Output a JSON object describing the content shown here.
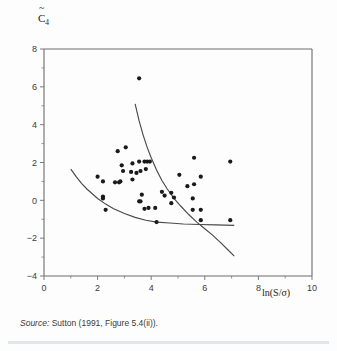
{
  "figure": {
    "ylabel_text": "C",
    "ylabel_sub": "4",
    "xlabel": "ln(S/σ)",
    "source_word": "Source:",
    "source_rest": " Sutton (1991, Figure 5.4(ii))."
  },
  "chart_data": {
    "type": "scatter",
    "title": "",
    "xlabel": "ln(S/σ)",
    "ylabel": "C̄4 (C-tilde sub 4)",
    "xlim": [
      0,
      10
    ],
    "ylim": [
      -4,
      8
    ],
    "xticks": [
      0,
      2,
      4,
      6,
      8,
      10
    ],
    "xticklabels": [
      "0",
      "2",
      "4",
      "6",
      "8",
      "10"
    ],
    "xminorticks": [
      1,
      3,
      5,
      7,
      9
    ],
    "yticks": [
      -4,
      -2,
      0,
      2,
      4,
      6,
      8
    ],
    "yticklabels": [
      "−4",
      "−2",
      "0",
      "2",
      "4",
      "6",
      "8"
    ],
    "yminorticks": [
      -3,
      -1,
      1,
      3,
      5,
      7
    ],
    "grid": false,
    "legend": null,
    "marker": "filled-circle",
    "marker_color": "#1a1a1a",
    "points": [
      [
        3.55,
        6.45
      ],
      [
        2.75,
        2.6
      ],
      [
        3.05,
        2.8
      ],
      [
        2.9,
        1.85
      ],
      [
        2.95,
        1.55
      ],
      [
        3.3,
        1.95
      ],
      [
        3.25,
        1.5
      ],
      [
        3.45,
        1.45
      ],
      [
        3.55,
        2.05
      ],
      [
        3.75,
        2.05
      ],
      [
        3.85,
        2.05
      ],
      [
        3.95,
        2.05
      ],
      [
        3.6,
        1.55
      ],
      [
        3.8,
        1.65
      ],
      [
        3.3,
        1.1
      ],
      [
        2.0,
        1.25
      ],
      [
        2.2,
        1.0
      ],
      [
        2.65,
        0.95
      ],
      [
        2.8,
        0.95
      ],
      [
        2.85,
        1.0
      ],
      [
        2.2,
        0.2
      ],
      [
        2.2,
        0.1
      ],
      [
        2.3,
        -0.5
      ],
      [
        3.55,
        -0.05
      ],
      [
        3.6,
        -0.05
      ],
      [
        3.75,
        -0.45
      ],
      [
        3.9,
        -0.4
      ],
      [
        4.15,
        -0.4
      ],
      [
        4.2,
        -1.15
      ],
      [
        3.65,
        0.3
      ],
      [
        4.4,
        0.45
      ],
      [
        4.5,
        0.25
      ],
      [
        4.75,
        -0.15
      ],
      [
        4.85,
        0.15
      ],
      [
        4.75,
        0.4
      ],
      [
        5.05,
        1.35
      ],
      [
        5.6,
        2.25
      ],
      [
        5.35,
        0.75
      ],
      [
        5.6,
        0.85
      ],
      [
        5.85,
        1.25
      ],
      [
        5.55,
        0.1
      ],
      [
        5.55,
        -0.5
      ],
      [
        5.85,
        -0.5
      ],
      [
        5.85,
        -1.05
      ],
      [
        6.95,
        2.05
      ],
      [
        6.95,
        -1.05
      ]
    ],
    "curves": [
      {
        "name": "steep-curve",
        "points": [
          [
            3.4,
            5.1
          ],
          [
            3.55,
            4.2
          ],
          [
            3.7,
            3.45
          ],
          [
            3.85,
            2.8
          ],
          [
            4.0,
            2.25
          ],
          [
            4.2,
            1.6
          ],
          [
            4.4,
            1.05
          ],
          [
            4.6,
            0.6
          ],
          [
            4.85,
            0.1
          ],
          [
            5.1,
            -0.3
          ],
          [
            5.4,
            -0.75
          ],
          [
            5.7,
            -1.15
          ],
          [
            6.0,
            -1.5
          ],
          [
            6.3,
            -1.85
          ],
          [
            6.6,
            -2.25
          ],
          [
            6.85,
            -2.6
          ],
          [
            7.1,
            -2.95
          ]
        ]
      },
      {
        "name": "flat-curve",
        "points": [
          [
            1.0,
            1.65
          ],
          [
            1.2,
            1.25
          ],
          [
            1.4,
            0.9
          ],
          [
            1.6,
            0.6
          ],
          [
            1.8,
            0.35
          ],
          [
            2.0,
            0.1
          ],
          [
            2.3,
            -0.2
          ],
          [
            2.6,
            -0.45
          ],
          [
            3.0,
            -0.7
          ],
          [
            3.4,
            -0.9
          ],
          [
            3.8,
            -1.05
          ],
          [
            4.2,
            -1.15
          ],
          [
            4.7,
            -1.2
          ],
          [
            5.2,
            -1.25
          ],
          [
            5.8,
            -1.28
          ],
          [
            6.4,
            -1.3
          ],
          [
            7.1,
            -1.32
          ]
        ]
      }
    ]
  }
}
